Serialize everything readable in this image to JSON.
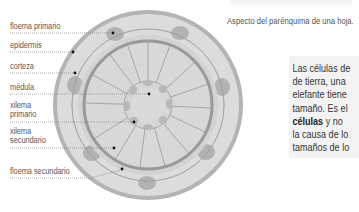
{
  "diagram": {
    "labels": [
      {
        "id": "floema-primario",
        "text": "floema primario"
      },
      {
        "id": "epidermis",
        "text": "epidermis"
      },
      {
        "id": "corteza",
        "text": "corteza"
      },
      {
        "id": "medula",
        "text": "médula"
      },
      {
        "id": "xilema-primario",
        "text": "xilema primario"
      },
      {
        "id": "xilema-secundario",
        "text": "xilema secundario"
      },
      {
        "id": "floema-secundario",
        "text": "floema secundario"
      }
    ],
    "colors": {
      "outer_ring": "#a9a9a9",
      "cortex_fill": "#d9d9d9",
      "inner_fill": "#d0d0d0",
      "cambium_ring": "#9a9a9a",
      "phloem_bundles": "#b0b0b0",
      "leader_line": "#777777",
      "dot": "#111111"
    }
  },
  "caption": "Aspecto del parénquima de una hoja.",
  "textbox": {
    "line1": "Las células de",
    "line2": "de tierra, una",
    "line3": "elefante tiene",
    "line4": "tamaño. Es el",
    "line5_bold": "células",
    "line5_rest": " y no",
    "line6": "la causa de lo",
    "line7": "tamaños de lo"
  }
}
